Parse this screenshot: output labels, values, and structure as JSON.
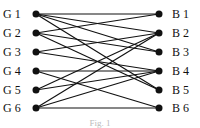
{
  "diagram": {
    "type": "bipartite-graph",
    "left_nodes": [
      {
        "id": "G1",
        "label": "G 1",
        "y": 14
      },
      {
        "id": "G2",
        "label": "G 2",
        "y": 33
      },
      {
        "id": "G3",
        "label": "G 3",
        "y": 52
      },
      {
        "id": "G4",
        "label": "G 4",
        "y": 71
      },
      {
        "id": "G5",
        "label": "G 5",
        "y": 90
      },
      {
        "id": "G6",
        "label": "G 6",
        "y": 108
      }
    ],
    "right_nodes": [
      {
        "id": "B1",
        "label": "B 1",
        "y": 14
      },
      {
        "id": "B2",
        "label": "B 2",
        "y": 33
      },
      {
        "id": "B3",
        "label": "B 3",
        "y": 52
      },
      {
        "id": "B4",
        "label": "B 4",
        "y": 71
      },
      {
        "id": "B5",
        "label": "B 5",
        "y": 90
      },
      {
        "id": "B6",
        "label": "B 6",
        "y": 108
      }
    ],
    "edges": [
      [
        "G1",
        "B1"
      ],
      [
        "G1",
        "B2"
      ],
      [
        "G1",
        "B3"
      ],
      [
        "G1",
        "B5"
      ],
      [
        "G2",
        "B1"
      ],
      [
        "G2",
        "B3"
      ],
      [
        "G2",
        "B5"
      ],
      [
        "G3",
        "B2"
      ],
      [
        "G3",
        "B4"
      ],
      [
        "G4",
        "B4"
      ],
      [
        "G4",
        "B6"
      ],
      [
        "G5",
        "B2"
      ],
      [
        "G5",
        "B4"
      ],
      [
        "G6",
        "B2"
      ],
      [
        "G6",
        "B4"
      ],
      [
        "G6",
        "B6"
      ]
    ],
    "layout": {
      "left_x": 36,
      "right_x": 159,
      "left_label_x": 3,
      "right_label_x": 172,
      "node_radius": 3.5
    },
    "caption": "Fig. 1",
    "colors": {
      "stroke": "#111111",
      "background": "#ffffff"
    }
  }
}
